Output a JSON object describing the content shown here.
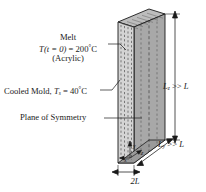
{
  "figure": {
    "name": "injection-molded-acrylic-slab-diagram",
    "colors": {
      "front_face": "#d4d4d4",
      "side_face": "#a8a8a8",
      "top_face": "#bdbdbd",
      "outline": "#1a1a1a",
      "dashed_line": "#2b2b2b",
      "background": "#ffffff"
    },
    "labels": {
      "melt_title": "Melt",
      "melt_temp_var": "T",
      "melt_temp_arg": "(t = 0)",
      "melt_temp_eq": " = 200",
      "melt_temp_unit": "C",
      "melt_material": "(Acrylic)",
      "mold_text": "Cooled Mold, ",
      "mold_var": "T",
      "mold_sub": "s",
      "mold_eq": " = 40",
      "mold_unit": "C",
      "symmetry": "Plane of Symmetry",
      "lz_var": "L",
      "lz_sub": "z",
      "lz_rel": " >> ",
      "lz_ref": "L",
      "ly_var": "L",
      "ly_sub": "y",
      "ly_rel": " >> ",
      "ly_ref": "L",
      "thickness": "2L",
      "axis_x": "x",
      "axis_y": "y",
      "axis_z": "z",
      "degree": "°"
    }
  }
}
